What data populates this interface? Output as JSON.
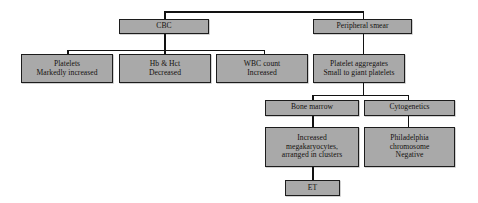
{
  "diagram": {
    "type": "flowchart",
    "colors": {
      "node_fill": "#a9a9a9",
      "node_border": "#1c1c1c",
      "connector": "#121212",
      "background": "#ffffff",
      "text": "#14110f"
    },
    "nodes": [
      {
        "id": "cbc",
        "lines": [
          "CBC"
        ],
        "level": 1
      },
      {
        "id": "peripheral-smear",
        "lines": [
          "Peripheral smear"
        ],
        "level": 1
      },
      {
        "id": "platelets",
        "lines": [
          "Platelets",
          "Markedly increased"
        ],
        "level": 2
      },
      {
        "id": "hb-hct",
        "lines": [
          "Hb & Hct",
          "Decreased"
        ],
        "level": 2
      },
      {
        "id": "wbc-count",
        "lines": [
          "WBC count",
          "Increased"
        ],
        "level": 2
      },
      {
        "id": "platelet-aggregates",
        "lines": [
          "Platelet aggregates",
          "Small to giant platelets"
        ],
        "level": 2
      },
      {
        "id": "bone-marrow",
        "lines": [
          "Bone marrow"
        ],
        "level": 3
      },
      {
        "id": "cytogenetics",
        "lines": [
          "Cytogenetics"
        ],
        "level": 3
      },
      {
        "id": "megakaryocytes",
        "lines": [
          "Increased",
          "megakaryocytes,",
          "arranged in clusters"
        ],
        "level": 4
      },
      {
        "id": "philadelphia",
        "lines": [
          "Philadelphia",
          "chromosome",
          "Negative"
        ],
        "level": 4
      },
      {
        "id": "et",
        "lines": [
          "ET"
        ],
        "level": 5
      }
    ]
  }
}
